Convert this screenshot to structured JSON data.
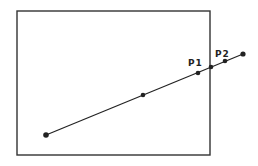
{
  "diagram": {
    "rectangle": {
      "x": 17,
      "y": 11,
      "width": 193,
      "height": 144,
      "stroke": "#333333"
    },
    "line": {
      "x1": 46,
      "y1": 135,
      "x2": 243,
      "y2": 54,
      "stroke": "#222222"
    },
    "points": [
      {
        "name": "start",
        "x": 46,
        "y": 135,
        "r": 2.8
      },
      {
        "name": "mid",
        "x": 143,
        "y": 95,
        "r": 2.3
      },
      {
        "name": "P1",
        "x": 198,
        "y": 73,
        "r": 2.3
      },
      {
        "name": "intersection",
        "x": 211,
        "y": 67,
        "r": 2.3
      },
      {
        "name": "P2",
        "x": 225,
        "y": 61,
        "r": 2.3
      },
      {
        "name": "end",
        "x": 243,
        "y": 54,
        "r": 2.6
      }
    ],
    "labels": [
      {
        "text": "P1",
        "x": 188,
        "y": 66
      },
      {
        "text": "P2",
        "x": 215,
        "y": 57
      }
    ]
  }
}
